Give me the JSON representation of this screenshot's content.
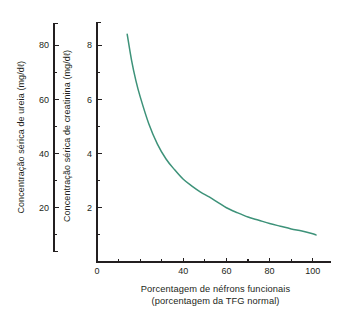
{
  "chart_data": {
    "type": "line",
    "title": "",
    "subtitle": "",
    "xlabel_line1": "Porcentagem de néfrons funcionais",
    "xlabel_line2": "(porcentagem da TFG normal)",
    "ylabel_left": "Concentração sérica de ureia (mg/dℓ)",
    "ylabel_right": "Concentração sérica de creatinina (mg/dℓ)",
    "xlim": [
      0,
      108
    ],
    "xticks_labeled": [
      0,
      40,
      60,
      80,
      100
    ],
    "xtick_labels": [
      "0",
      "40",
      "60",
      "80",
      "100"
    ],
    "xticks_minor": [
      10,
      20,
      30,
      50,
      70,
      90
    ],
    "ylim_urea": [
      0,
      90
    ],
    "yticks_urea_labeled": [
      20,
      40,
      60,
      80
    ],
    "ytick_labels_urea": [
      "20",
      "40",
      "60",
      "80"
    ],
    "yticks_urea_minor": [
      10,
      30,
      50,
      70,
      90
    ],
    "ylim_creatinine": [
      0,
      9
    ],
    "yticks_creatinine_labeled": [
      2,
      4,
      6,
      8
    ],
    "ytick_labels_creatinine": [
      "2",
      "4",
      "6",
      "8"
    ],
    "yticks_creatinine_minor": [
      1,
      3,
      5,
      7,
      9
    ],
    "grid": false,
    "legend": false,
    "series": [
      {
        "name": "Concentração sérica (ureia / creatinina)",
        "color": "#3d9279",
        "x": [
          14,
          16,
          18,
          20,
          24,
          28,
          32,
          36,
          40,
          44,
          48,
          52,
          56,
          60,
          65,
          70,
          75,
          80,
          85,
          90,
          95,
          100,
          101.5
        ],
        "y_creatinine": [
          8.4,
          7.45,
          6.7,
          6.1,
          5.1,
          4.35,
          3.8,
          3.4,
          3.05,
          2.8,
          2.58,
          2.4,
          2.2,
          2.0,
          1.82,
          1.66,
          1.54,
          1.42,
          1.32,
          1.22,
          1.14,
          1.04,
          1.0
        ],
        "y_urea": [
          84,
          74.5,
          67,
          61,
          51,
          43.5,
          38,
          34,
          30.5,
          28,
          25.8,
          24,
          22,
          20,
          18.2,
          16.6,
          15.4,
          14.2,
          13.2,
          12.2,
          11.4,
          10.4,
          10
        ]
      }
    ],
    "axis_scale_note": "urea = creatinina x 10",
    "colors": {
      "curve": "#3d9279",
      "axis": "#231f20",
      "text": "#231f20",
      "background": "#ffffff"
    }
  }
}
